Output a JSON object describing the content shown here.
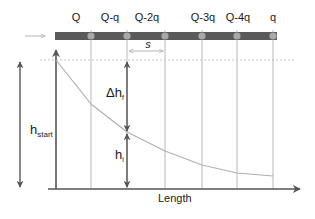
{
  "diagram": {
    "outlet_labels": [
      "Q",
      "Q-q",
      "Q-2q",
      "Q-3q",
      "Q-4q",
      "q"
    ],
    "outlet_x": [
      91,
      127,
      165,
      202,
      237,
      273
    ],
    "spacing_label": "s",
    "delta_h_label": "Δh",
    "delta_h_sub": "f",
    "h_i_label": "h",
    "h_i_sub": "i",
    "h_start_label": "h",
    "h_start_sub": "start",
    "x_axis_label": "Length",
    "curve_points": [
      [
        56,
        60
      ],
      [
        91,
        104
      ],
      [
        127,
        132
      ],
      [
        165,
        151
      ],
      [
        202,
        165
      ],
      [
        237,
        173
      ],
      [
        273,
        176
      ]
    ],
    "colors": {
      "pipe": "#5a5a5a",
      "outlet": "#a8a8a8",
      "axis": "#555555",
      "grid": "#b8b8b8",
      "curve": "#b0b0b0",
      "inflow_arrow": "#b5b5b5"
    }
  }
}
